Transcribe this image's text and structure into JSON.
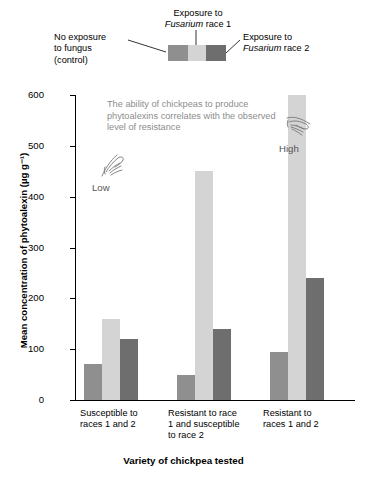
{
  "legend": {
    "left_label_lines": [
      "No exposure",
      "to fungus",
      "(control)"
    ],
    "top_label_line1": "Exposure to",
    "top_label_italic": "Fusarium",
    "top_label_line2_tail": " race 1",
    "right_label_line1": "Exposure to",
    "right_label_italic": "Fusarium",
    "right_label_line2_tail": " race 2"
  },
  "annotation": {
    "text": "The ability of chickpeas to produce phytoalexins correlates with the observed level of resistance",
    "low_label": "Low",
    "high_label": "High"
  },
  "chart_data": {
    "type": "bar",
    "title": "",
    "xlabel": "Variety of chickpea tested",
    "ylabel": "Mean concentration of phytoalexin (µg g⁻¹)",
    "ylim": [
      0,
      600
    ],
    "yticks": [
      0,
      100,
      200,
      300,
      400,
      500,
      600
    ],
    "ytick_labels": [
      "0",
      "100",
      "200",
      "300",
      "400",
      "500",
      "600"
    ],
    "grid": false,
    "legend_position": "top",
    "categories": [
      "Susceptible to races 1 and 2",
      "Resistant to race 1 and susceptible to race 2",
      "Resistant to races 1 and 2"
    ],
    "category_label_lines": [
      [
        "Susceptible to",
        "races 1 and 2"
      ],
      [
        "Resistant to race",
        "1 and susceptible",
        "to race 2"
      ],
      [
        "Resistant to",
        "races 1 and 2"
      ]
    ],
    "series": [
      {
        "name": "No exposure to fungus (control)",
        "color": "#8f8f8f",
        "values": [
          70,
          50,
          95
        ]
      },
      {
        "name": "Exposure to Fusarium race 1",
        "color": "#d4d4d4",
        "values": [
          160,
          450,
          600
        ]
      },
      {
        "name": "Exposure to Fusarium race 2",
        "color": "#6e6e6e",
        "values": [
          120,
          140,
          240
        ]
      }
    ]
  }
}
